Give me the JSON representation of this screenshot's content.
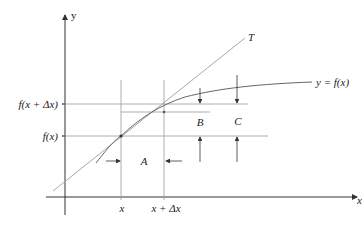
{
  "diagram": {
    "axes": {
      "x_label": "x",
      "y_label": "y"
    },
    "tick_labels": {
      "x1": "x",
      "x2": "x + Δx",
      "y1": "f(x)",
      "y2": "f(x + Δx)"
    },
    "curve_label": "y = f(x)",
    "tangent_label": "T",
    "region_labels": {
      "A": "A",
      "B": "B",
      "C": "C"
    },
    "colors": {
      "axis": "#333333",
      "grid": "#9a9a9a",
      "curve": "#666666",
      "tangent": "#a8a8a8"
    }
  }
}
